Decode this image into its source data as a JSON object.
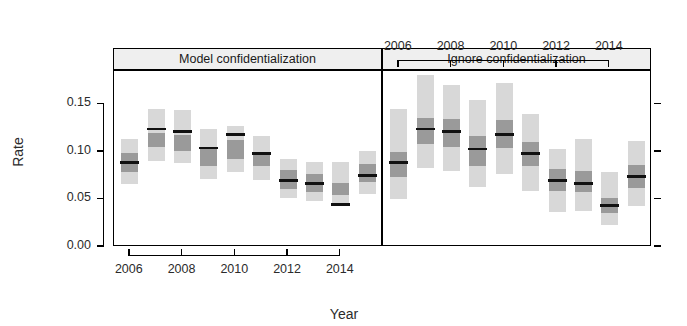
{
  "chart_data": {
    "type": "bar",
    "title": "",
    "subtitle": "",
    "xlabel": "Year",
    "ylabel": "Rate",
    "ylim": [
      0.0,
      0.185
    ],
    "xlim": [
      2005.4,
      2015.6
    ],
    "grid": false,
    "legend": false,
    "legend_position": "none",
    "y_ticks": [
      "0.00",
      "0.05",
      "0.10",
      "0.15"
    ],
    "y_tick_values": [
      0.0,
      0.05,
      0.1,
      0.15
    ],
    "x_ticks": [
      "2006",
      "2008",
      "2010",
      "2012",
      "2014"
    ],
    "x_tick_values": [
      2006,
      2008,
      2010,
      2012,
      2014
    ],
    "glyph_description": "credible interval bands: light grey = wide interval, dark grey = narrow interval, black line = point estimate",
    "colors": {
      "outer_band": "#d8d8d8",
      "inner_band": "#9a9a9a",
      "median_line": "#111111",
      "panel_strip": "#efefef",
      "frame": "#000000"
    },
    "panels": [
      {
        "label": "Model confidentialization",
        "axis_position": "bottom",
        "categories": [
          2006,
          2007,
          2008,
          2009,
          2010,
          2011,
          2012,
          2013,
          2014,
          2015
        ],
        "series": [
          {
            "name": "point estimate",
            "values": [
              0.089,
              0.124,
              0.121,
              0.104,
              0.118,
              0.098,
              0.07,
              0.067,
              0.045,
              0.075
            ]
          },
          {
            "name": "inner interval lower",
            "values": [
              0.079,
              0.105,
              0.101,
              0.085,
              0.092,
              0.085,
              0.061,
              0.058,
              0.055,
              0.068
            ]
          },
          {
            "name": "inner interval upper",
            "values": [
              0.099,
              0.12,
              0.118,
              0.103,
              0.112,
              0.098,
              0.081,
              0.077,
              0.067,
              0.087
            ]
          },
          {
            "name": "outer interval lower",
            "values": [
              0.066,
              0.09,
              0.088,
              0.072,
              0.079,
              0.07,
              0.051,
              0.048,
              0.044,
              0.056
            ]
          },
          {
            "name": "outer interval upper",
            "values": [
              0.113,
              0.145,
              0.144,
              0.124,
              0.127,
              0.117,
              0.093,
              0.089,
              0.089,
              0.101
            ]
          }
        ]
      },
      {
        "label": "Ignore confidentialization",
        "axis_position": "top",
        "categories": [
          2006,
          2007,
          2008,
          2009,
          2010,
          2011,
          2012,
          2013,
          2014,
          2015
        ],
        "series": [
          {
            "name": "point estimate",
            "values": [
              0.089,
              0.124,
              0.121,
              0.103,
              0.118,
              0.098,
              0.07,
              0.067,
              0.044,
              0.074
            ]
          },
          {
            "name": "inner interval lower",
            "values": [
              0.074,
              0.108,
              0.105,
              0.085,
              0.104,
              0.085,
              0.059,
              0.058,
              0.036,
              0.062
            ]
          },
          {
            "name": "inner interval upper",
            "values": [
              0.1,
              0.136,
              0.135,
              0.117,
              0.133,
              0.11,
              0.082,
              0.08,
              0.052,
              0.086
            ]
          },
          {
            "name": "outer interval lower",
            "values": [
              0.05,
              0.083,
              0.08,
              0.063,
              0.077,
              0.059,
              0.037,
              0.038,
              0.023,
              0.043
            ]
          },
          {
            "name": "outer interval upper",
            "values": [
              0.145,
              0.181,
              0.17,
              0.155,
              0.172,
              0.14,
              0.103,
              0.113,
              0.079,
              0.111
            ]
          }
        ]
      }
    ]
  },
  "axes": {
    "y_title": "Rate",
    "x_title": "Year"
  }
}
